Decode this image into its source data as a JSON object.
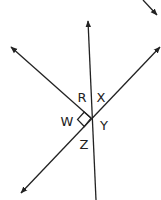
{
  "diagram": {
    "type": "intersecting-lines",
    "stroke_color": "#222222",
    "labels": {
      "R": "R",
      "X": "X",
      "W": "W",
      "Y": "Y",
      "Z": "Z"
    },
    "angles": [
      {
        "label": "R",
        "position": "upper-left, between vertical line and upper-left ray"
      },
      {
        "label": "X",
        "position": "upper-right, between vertical line and upper-right ray"
      },
      {
        "label": "W",
        "position": "left, between upper-left ray and lower-left ray",
        "right_angle": true
      },
      {
        "label": "Y",
        "position": "right, between upper-right ray and vertical line below"
      },
      {
        "label": "Z",
        "position": "lower, between lower-left ray and vertical line below"
      }
    ],
    "lines": [
      {
        "name": "vertical-line",
        "arrow": "top"
      },
      {
        "name": "descending-line",
        "arrow": "upper-left"
      },
      {
        "name": "ascending-line",
        "arrows": [
          "upper-right",
          "lower-left"
        ]
      }
    ]
  }
}
